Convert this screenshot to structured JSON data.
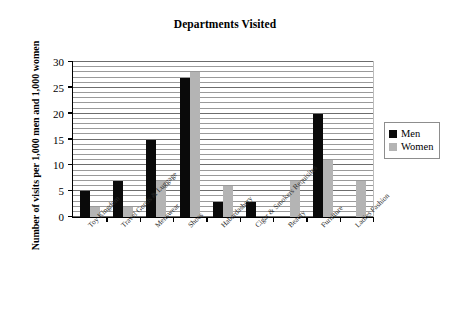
{
  "chart_data": {
    "type": "bar",
    "title": "Departments Visited",
    "xlabel": "",
    "ylabel": "Number of visits per 1,000 men and 1,000 women",
    "ylim": [
      0,
      30
    ],
    "yticks": [
      0,
      5,
      10,
      15,
      20,
      25,
      30
    ],
    "grid": true,
    "grid_interval": 1,
    "legend_position": "right",
    "categories": [
      "Toy Kingdom",
      "Travel Goods & Luggage",
      "Menswear",
      "Shoes",
      "Haberdashery",
      "Cigar & Smokers Requisites",
      "Beauty",
      "Furniture",
      "Ladies Fashion"
    ],
    "series": [
      {
        "name": "Men",
        "color": "#0a0a0a",
        "values": [
          5,
          7,
          15,
          27,
          3,
          3,
          0,
          20,
          0
        ]
      },
      {
        "name": "Women",
        "color": "#b4b4b4",
        "values": [
          2,
          2,
          7,
          28,
          6,
          0,
          7,
          11,
          7
        ]
      }
    ]
  },
  "legend": {
    "items": [
      {
        "label": "Men",
        "swatch": "men"
      },
      {
        "label": "Women",
        "swatch": "women"
      }
    ]
  }
}
